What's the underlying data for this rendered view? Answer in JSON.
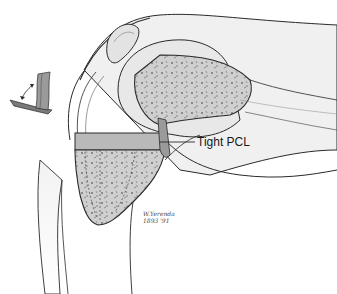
{
  "figure": {
    "labels": {
      "pcl": "Tight PCL"
    },
    "signature": {
      "name": "W.Yerenda",
      "date": "1893 '91"
    },
    "colors": {
      "outline": "#2a2a2a",
      "bone_fill": "#cfcfcf",
      "bone_speckle": "#6a6a6a",
      "soft_tissue": "#ececec",
      "cut_block": "#b9b9b9",
      "background": "#ffffff"
    }
  }
}
